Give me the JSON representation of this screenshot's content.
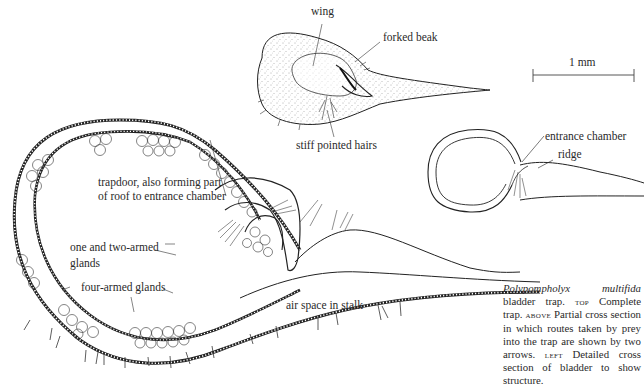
{
  "figure": {
    "title": "Polypompholyx multifida bladder trap",
    "scale_bar": {
      "label": "1 mm"
    },
    "top_view": {
      "labels": {
        "wing": "wing",
        "forked_beak": "forked beak",
        "stiff_hairs": "stiff pointed hairs"
      }
    },
    "above_view": {
      "labels": {
        "entrance_chamber": "entrance chamber",
        "ridge": "ridge"
      }
    },
    "left_view": {
      "labels": {
        "trapdoor_line1": "trapdoor, also forming part",
        "trapdoor_line2": "of roof to entrance chamber",
        "one_two_line1": "one and two-armed",
        "one_two_line2": "glands",
        "four_armed": "four-armed glands",
        "air_space": "air space in stalk"
      }
    },
    "caption": {
      "species": "Polypompholyx multifida",
      "s1": " bladder trap. ",
      "top_tag": "top",
      "s2": " Complete trap. ",
      "above_tag": "above",
      "s3": " Partial cross section in which routes taken by prey into the trap are shown by two arrows. ",
      "left_tag": "left",
      "s4": " Detailed cross section of bladder to show structure."
    }
  }
}
